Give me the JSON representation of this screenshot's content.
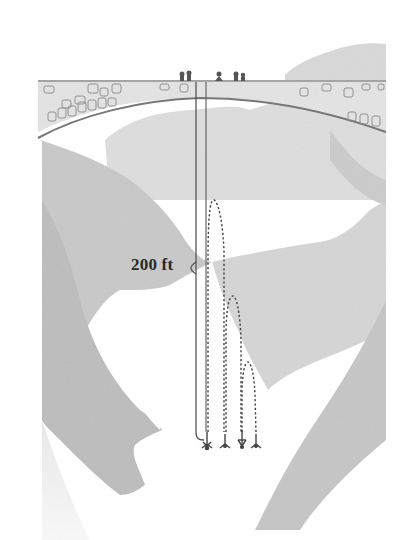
{
  "figure": {
    "height_label": "200 ft",
    "bounce_count": 4,
    "colors": {
      "background": "#ffffff",
      "mountain_light": "#e2e2e2",
      "mountain_mid": "#cfcfcf",
      "mountain_dark": "#bcbcbc",
      "bridge_fill": "#e6e6e6",
      "line": "#555555",
      "label": "#2a2a2a"
    }
  }
}
